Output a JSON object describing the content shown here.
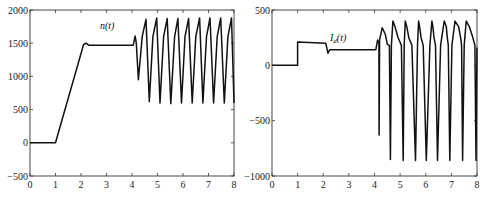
{
  "chart_data": [
    {
      "type": "line",
      "title": "",
      "xlabel": "",
      "ylabel": "",
      "annotation": "n(t)",
      "xlim": [
        0,
        8
      ],
      "ylim": [
        -500,
        2000
      ],
      "xticks": [
        "0",
        "1",
        "2",
        "3",
        "4",
        "5",
        "6",
        "7",
        "8"
      ],
      "yticks": [
        "2000",
        "1500",
        "1000",
        "500",
        "0",
        "−500"
      ],
      "ytick_values": [
        2000,
        1500,
        1000,
        500,
        0,
        -500
      ],
      "grid": false,
      "series": [
        {
          "name": "n(t)",
          "x": [
            0,
            1.0,
            2.1,
            2.2,
            2.3,
            4.05,
            4.12,
            4.17,
            4.25,
            4.4,
            4.55,
            4.68,
            4.82,
            4.97,
            5.1,
            5.24,
            5.38,
            5.52,
            5.67,
            5.8,
            5.94,
            6.08,
            6.22,
            6.36,
            6.5,
            6.65,
            6.78,
            6.92,
            7.06,
            7.2,
            7.34,
            7.48,
            7.62,
            7.76,
            7.9,
            8.0
          ],
          "values": [
            0,
            0,
            1480,
            1500,
            1470,
            1470,
            1610,
            1500,
            950,
            1600,
            1860,
            620,
            1600,
            1880,
            600,
            1600,
            1870,
            590,
            1600,
            1870,
            600,
            1600,
            1870,
            600,
            1600,
            1880,
            600,
            1600,
            1880,
            600,
            1600,
            1880,
            600,
            1600,
            1880,
            600
          ]
        }
      ]
    },
    {
      "type": "line",
      "title": "",
      "xlabel": "",
      "ylabel": "",
      "annotation": "I_d(t)",
      "xlim": [
        0,
        8
      ],
      "ylim": [
        -1000,
        500
      ],
      "xticks": [
        "0",
        "1",
        "2",
        "3",
        "4",
        "5",
        "6",
        "7",
        "8"
      ],
      "yticks": [
        "500",
        "0",
        "−500",
        "−1000"
      ],
      "ytick_values": [
        500,
        0,
        -500,
        -1000
      ],
      "grid": false,
      "series": [
        {
          "name": "I_d(t)",
          "x": [
            0,
            1.0,
            1.0,
            2.1,
            2.18,
            2.25,
            4.05,
            4.12,
            4.17,
            4.18,
            4.2,
            4.3,
            4.42,
            4.5,
            4.58,
            4.62,
            4.66,
            4.72,
            4.8,
            4.92,
            5.05,
            5.12,
            5.16,
            5.2,
            5.26,
            5.34,
            5.46,
            5.6,
            5.68,
            5.72,
            5.76,
            5.82,
            5.9,
            6.02,
            6.16,
            6.24,
            6.28,
            6.32,
            6.38,
            6.46,
            6.58,
            6.72,
            6.8,
            6.84,
            6.88,
            6.94,
            7.02,
            7.14,
            7.28,
            7.36,
            7.4,
            7.44,
            7.5,
            7.58,
            7.7,
            7.84,
            7.92,
            7.96,
            8.0
          ],
          "values": [
            0,
            0,
            210,
            200,
            110,
            140,
            140,
            230,
            200,
            -630,
            230,
            340,
            280,
            190,
            180,
            -850,
            180,
            400,
            350,
            250,
            180,
            -860,
            180,
            400,
            350,
            250,
            180,
            -860,
            180,
            400,
            350,
            250,
            180,
            -860,
            180,
            400,
            350,
            250,
            180,
            -860,
            180,
            400,
            350,
            250,
            180,
            -860,
            180,
            400,
            350,
            250,
            180,
            -860,
            180,
            400,
            350,
            250,
            180,
            -860,
            160
          ]
        }
      ]
    }
  ]
}
